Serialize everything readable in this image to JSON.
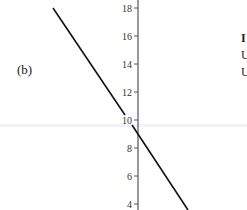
{
  "panel": {
    "label": "(b)"
  },
  "side_text": [
    "I",
    "U",
    "U"
  ],
  "chart_data": {
    "type": "line",
    "title": "",
    "xlabel": "",
    "ylabel": "",
    "y_ticks": [
      4,
      6,
      8,
      10,
      12,
      14,
      16,
      18
    ],
    "ylim": [
      3.6,
      18.6
    ],
    "grid": false,
    "legend": null,
    "series": [
      {
        "name": "line",
        "points": [
          [
            -6.0,
            18.0
          ],
          [
            0.0,
            9.1
          ],
          [
            3.6,
            3.7
          ]
        ],
        "color": "#111111"
      }
    ],
    "annotations": [
      "(b)"
    ],
    "y_intercept": 9.1
  }
}
